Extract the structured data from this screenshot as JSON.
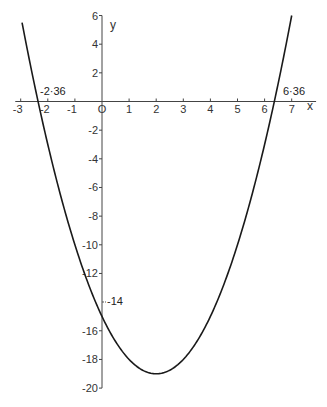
{
  "chart_data": {
    "type": "line",
    "title": "",
    "function": "y = x^2 - 4x - 15",
    "xlabel": "x",
    "ylabel": "y",
    "xlim": [
      -3,
      7
    ],
    "ylim": [
      -20,
      6
    ],
    "x_ticks": [
      -3,
      -2,
      -1,
      0,
      1,
      2,
      3,
      4,
      5,
      6,
      7
    ],
    "x_tick_labels": [
      "-3",
      "-2",
      "-1",
      "O",
      "1",
      "2",
      "3",
      "4",
      "5",
      "6",
      "7"
    ],
    "y_ticks": [
      6,
      4,
      2,
      -2,
      -4,
      -6,
      -8,
      -10,
      -12,
      -14,
      -16,
      -18,
      -20
    ],
    "y_tick_labels": [
      "6",
      "4",
      "2",
      "-2",
      "-4",
      "-6",
      "-8",
      "-10",
      "-12",
      "-14",
      "-16",
      "-18",
      "-20"
    ],
    "grid": false,
    "series": [
      {
        "name": "parabola",
        "x": [
          -2.95,
          -2.36,
          -2,
          -1,
          0,
          1,
          2,
          3,
          4,
          5,
          6,
          6.36,
          7
        ],
        "y": [
          5.5,
          0,
          -3,
          -10,
          -15,
          -18,
          -19,
          -18,
          -15,
          -10,
          -3,
          0,
          6
        ]
      }
    ],
    "annotations": [
      {
        "text": "-2·36",
        "x": -2.36,
        "y": 0,
        "meaning": "negative root"
      },
      {
        "text": "6·36",
        "x": 6.36,
        "y": 0,
        "meaning": "positive root"
      },
      {
        "text": "-14",
        "x": 0,
        "y": -14,
        "meaning": "marked y-axis value"
      }
    ]
  },
  "labels": {
    "x_axis": "x",
    "y_axis": "y",
    "root_left": "-2·36",
    "root_right": "6·36",
    "y_mark": "-14"
  }
}
